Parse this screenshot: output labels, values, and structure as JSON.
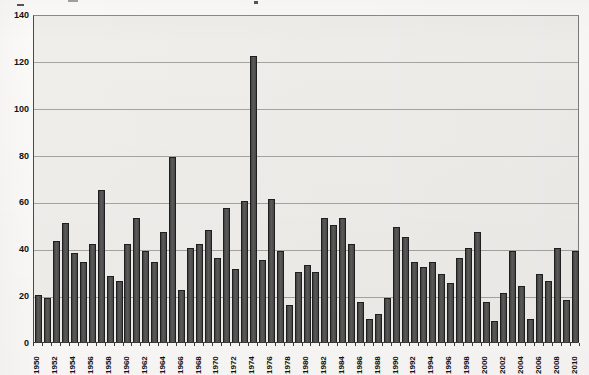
{
  "page": {
    "title_fragment": "",
    "colors": {
      "page_bg": "#fbfaf8",
      "plot_bg": "#f0eeeb",
      "bar_fill": "#4d4d4d",
      "bar_border": "#1f1f1f",
      "gridline": "#a6a4a1",
      "tick_text": "#111111"
    }
  },
  "chart_data": {
    "type": "bar",
    "title": "",
    "xlabel": "",
    "ylabel": "",
    "ylim": [
      0,
      140
    ],
    "yticks": [
      0,
      20,
      40,
      60,
      80,
      100,
      120,
      140
    ],
    "xtick_label_step": 2,
    "grid": true,
    "legend_position": "none",
    "categories": [
      1950,
      1951,
      1952,
      1953,
      1954,
      1955,
      1956,
      1957,
      1958,
      1959,
      1960,
      1961,
      1962,
      1963,
      1964,
      1965,
      1966,
      1967,
      1968,
      1969,
      1970,
      1971,
      1972,
      1973,
      1974,
      1975,
      1976,
      1977,
      1978,
      1979,
      1980,
      1981,
      1982,
      1983,
      1984,
      1985,
      1986,
      1987,
      1988,
      1989,
      1990,
      1991,
      1992,
      1993,
      1994,
      1995,
      1996,
      1997,
      1998,
      1999,
      2000,
      2001,
      2002,
      2003,
      2004,
      2005,
      2006,
      2007,
      2008,
      2009,
      2010
    ],
    "values": [
      20,
      19,
      43,
      51,
      38,
      34,
      42,
      65,
      28,
      26,
      42,
      53,
      39,
      34,
      47,
      79,
      22,
      40,
      42,
      48,
      36,
      57,
      31,
      60,
      122,
      35,
      61,
      39,
      16,
      30,
      33,
      30,
      53,
      50,
      53,
      42,
      17,
      10,
      12,
      19,
      49,
      45,
      34,
      32,
      34,
      29,
      25,
      36,
      40,
      47,
      17,
      9,
      21,
      39,
      24,
      10,
      29,
      26,
      40,
      18,
      39
    ]
  }
}
